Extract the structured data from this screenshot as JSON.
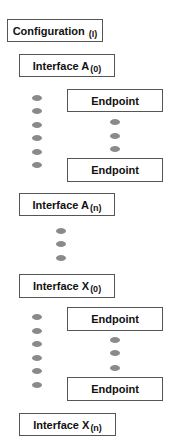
{
  "diagram": {
    "configuration": {
      "label": "Configuration",
      "sub": "(I)"
    },
    "interfaces": [
      {
        "label": "Interface A",
        "sub": "(0)"
      },
      {
        "label": "Interface A",
        "sub": "(n)"
      },
      {
        "label": "Interface X",
        "sub": "(0)"
      },
      {
        "label": "Interface X",
        "sub": "(n)"
      }
    ],
    "endpoints": [
      {
        "label": "Endpoint"
      },
      {
        "label": "Endpoint"
      },
      {
        "label": "Endpoint"
      },
      {
        "label": "Endpoint"
      }
    ],
    "colors": {
      "border": "#555555",
      "dot": "#8a8a8a"
    }
  }
}
